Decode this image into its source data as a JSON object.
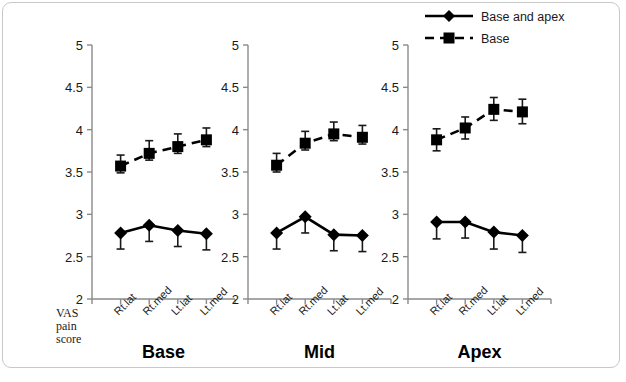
{
  "figure": {
    "y_axis_title_lines": [
      "VAS",
      "pain",
      "score"
    ]
  },
  "legend": {
    "items": [
      {
        "label": "Base and apex",
        "marker": "diamond",
        "line": "solid"
      },
      {
        "label": "Base",
        "marker": "square",
        "line": "dashed"
      }
    ]
  },
  "chart_data": {
    "type": "line",
    "title": "",
    "xlabel": "",
    "ylabel": "VAS pain score",
    "ylim": [
      2,
      5
    ],
    "yticks": [
      2,
      2.5,
      3,
      3.5,
      4,
      4.5,
      5
    ],
    "ytick_labels": [
      "2",
      "2.5",
      "3",
      "3.5",
      "4",
      "4.5",
      "5"
    ],
    "grid": false,
    "legend_position": "top-right",
    "categories": [
      "Rt.lat",
      "Rt.med",
      "Lt.lat",
      "Lt.med"
    ],
    "panels": [
      {
        "name": "Base",
        "series": [
          {
            "name": "Base and apex",
            "marker": "diamond",
            "line": "solid",
            "values": [
              2.78,
              2.87,
              2.81,
              2.77
            ],
            "err_low": [
              0.19,
              0.19,
              0.19,
              0.19
            ],
            "err_high": [
              0.0,
              0.0,
              0.0,
              0.0
            ]
          },
          {
            "name": "Base",
            "marker": "square",
            "line": "dashed",
            "values": [
              3.57,
              3.72,
              3.8,
              3.88
            ],
            "err_low": [
              0.08,
              0.08,
              0.08,
              0.08
            ],
            "err_high": [
              0.13,
              0.15,
              0.15,
              0.14
            ]
          }
        ]
      },
      {
        "name": "Mid",
        "series": [
          {
            "name": "Base and apex",
            "marker": "diamond",
            "line": "solid",
            "values": [
              2.78,
              2.97,
              2.76,
              2.75
            ],
            "err_low": [
              0.19,
              0.19,
              0.19,
              0.19
            ],
            "err_high": [
              0.0,
              0.0,
              0.0,
              0.0
            ]
          },
          {
            "name": "Base",
            "marker": "square",
            "line": "dashed",
            "values": [
              3.58,
              3.84,
              3.95,
              3.91
            ],
            "err_low": [
              0.08,
              0.08,
              0.08,
              0.08
            ],
            "err_high": [
              0.14,
              0.14,
              0.14,
              0.14
            ]
          }
        ]
      },
      {
        "name": "Apex",
        "series": [
          {
            "name": "Base and apex",
            "marker": "diamond",
            "line": "solid",
            "values": [
              2.91,
              2.91,
              2.79,
              2.75
            ],
            "err_low": [
              0.2,
              0.19,
              0.2,
              0.2
            ],
            "err_high": [
              0.0,
              0.0,
              0.0,
              0.0
            ]
          },
          {
            "name": "Base",
            "marker": "square",
            "line": "dashed",
            "values": [
              3.88,
              4.02,
              4.24,
              4.21
            ],
            "err_low": [
              0.13,
              0.13,
              0.13,
              0.14
            ],
            "err_high": [
              0.13,
              0.13,
              0.14,
              0.15
            ]
          }
        ]
      }
    ]
  }
}
